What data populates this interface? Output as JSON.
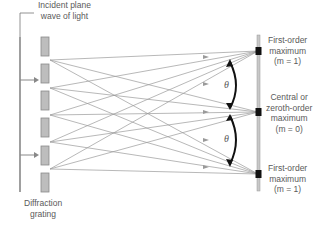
{
  "labels": {
    "incident": [
      "Incident plane",
      "wave of light"
    ],
    "grating": [
      "Diffraction",
      "grating"
    ],
    "first_order_top": [
      "First-order",
      "maximum",
      "(m = 1)"
    ],
    "central": [
      "Central or",
      "zeroth-order",
      "maximum",
      "(m = 0)"
    ],
    "first_order_bottom": [
      "First-order",
      "maximum",
      "(m = 1)"
    ],
    "theta": "θ"
  },
  "colors": {
    "rays": "#9a9a9a",
    "slit_fill": "#bdbdbd",
    "slit_stroke": "#8a8a8a",
    "screen": "#c8c8c8",
    "maxima": "#111111",
    "arc": "#111111",
    "wavefront": "#777777"
  },
  "geometry": {
    "slits_y": [
      37,
      64,
      91,
      118,
      146,
      173
    ],
    "sources_y": [
      60,
      88,
      115,
      142,
      169
    ],
    "maxima_y": [
      51,
      112,
      174
    ]
  }
}
